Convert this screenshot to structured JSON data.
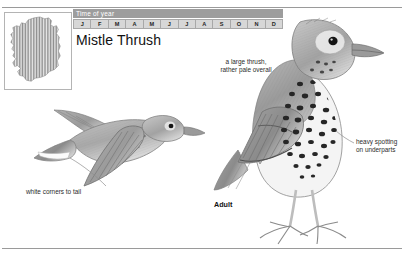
{
  "page": {
    "species_title": "Mistle Thrush",
    "plate_caption": "Adult"
  },
  "time_of_year": {
    "header": "Time of year",
    "months": [
      {
        "label": "J",
        "present": true
      },
      {
        "label": "F",
        "present": true
      },
      {
        "label": "M",
        "present": true
      },
      {
        "label": "A",
        "present": true
      },
      {
        "label": "M",
        "present": true
      },
      {
        "label": "J",
        "present": true
      },
      {
        "label": "J",
        "present": true
      },
      {
        "label": "A",
        "present": true
      },
      {
        "label": "S",
        "present": true
      },
      {
        "label": "O",
        "present": true
      },
      {
        "label": "N",
        "present": true
      },
      {
        "label": "D",
        "present": true
      }
    ]
  },
  "distribution_map": {
    "region": "Ireland",
    "fill_style": "vertical-hatch",
    "fill_color": "#8c8c8c"
  },
  "annotations": [
    {
      "id": "large-pale",
      "line1": "a large thrush,",
      "line2": "rather pale overall",
      "text": "a large thrush, rather pale overall"
    },
    {
      "id": "heavy-spotting",
      "line1": "heavy spotting",
      "line2": "on underparts",
      "text": "heavy spotting on underparts"
    },
    {
      "id": "white-corners",
      "line1": "white corners to tail",
      "line2": "",
      "text": "white corners to tail"
    }
  ],
  "illustrations": [
    {
      "id": "adult-perched",
      "label": "Adult",
      "orientation": "standing, facing right"
    },
    {
      "id": "bird-in-flight",
      "label": "",
      "orientation": "flying, facing right"
    }
  ],
  "colors": {
    "ink": "#2b2b2b",
    "rule": "#9a9a9a",
    "header_band": "#9d9d9d",
    "month_on": "#d7d7d7",
    "plumage_grey": "#8f8f8f",
    "spot_dark": "#2a2a2a"
  }
}
